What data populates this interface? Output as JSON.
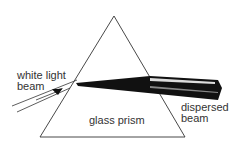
{
  "diagram": {
    "labels": {
      "incoming": [
        "white light",
        "beam"
      ],
      "prism": "glass prism",
      "outgoing": [
        "dispersed",
        "beam"
      ]
    },
    "colors": {
      "line": "#222222",
      "beam": "#111111",
      "text": "#333333"
    }
  }
}
